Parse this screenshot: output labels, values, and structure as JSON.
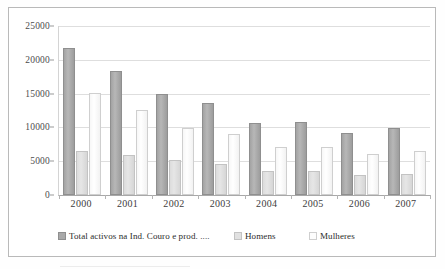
{
  "chart_data": {
    "type": "bar",
    "title": "",
    "xlabel": "",
    "ylabel": "",
    "categories": [
      "2000",
      "2001",
      "2002",
      "2003",
      "2004",
      "2005",
      "2006",
      "2007"
    ],
    "series": [
      {
        "name": "Total activos na Ind. Couro e prod. ....",
        "color": "#a9a9a9",
        "values": [
          21700,
          18400,
          14900,
          13650,
          10650,
          10750,
          9200,
          9850
        ]
      },
      {
        "name": "Homens",
        "color": "#e1e1e1",
        "values": [
          6500,
          5900,
          5200,
          4600,
          3550,
          3600,
          2900,
          3100
        ]
      },
      {
        "name": "Mulheres",
        "color": "#fdfdfd",
        "values": [
          15050,
          12550,
          9850,
          9050,
          7050,
          7100,
          6050,
          6450
        ]
      }
    ],
    "ylim": [
      0,
      25000
    ],
    "ytick_values": [
      0,
      5000,
      10000,
      15000,
      20000,
      25000
    ],
    "ytick_labels": [
      "0",
      "5000",
      "10000",
      "15000",
      "20000",
      "25000"
    ],
    "grid": true,
    "legend_position": "bottom"
  },
  "legend": {
    "entries": [
      {
        "label": "Total activos na Ind. Couro e prod. ....",
        "swatch": "series-0-swatch"
      },
      {
        "label": "Homens",
        "swatch": "series-1-swatch"
      },
      {
        "label": "Mulheres",
        "swatch": "series-2-swatch"
      }
    ]
  }
}
